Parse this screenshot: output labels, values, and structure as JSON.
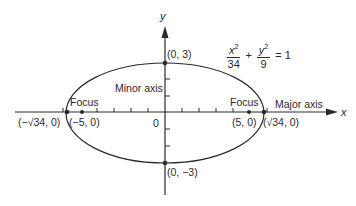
{
  "diagram": {
    "equation": {
      "term1_num_var": "x",
      "term1_num_exp": "2",
      "term1_den": "34",
      "plus": "+",
      "term2_num_var": "y",
      "term2_num_exp": "2",
      "term2_den": "9",
      "equals": "= 1"
    },
    "axes": {
      "x_label": "x",
      "y_label": "y",
      "origin_label": "0"
    },
    "labels": {
      "minor_axis": "Minor axis",
      "major_axis": "Major axis",
      "focus_left": "Focus",
      "focus_right": "Focus"
    },
    "points": {
      "top_vertex": "(0, 3)",
      "bottom_vertex": "(0, −3)",
      "left_vertex": "(−√34, 0)",
      "right_vertex": "(√34, 0)",
      "left_focus": "(−5, 0)",
      "right_focus": "(5, 0)"
    },
    "ellipse": {
      "semi_major": "√34",
      "semi_minor": "3",
      "foci_c": "5"
    },
    "colors": {
      "stroke": "#2a2a2a",
      "background": "#ffffff"
    }
  }
}
